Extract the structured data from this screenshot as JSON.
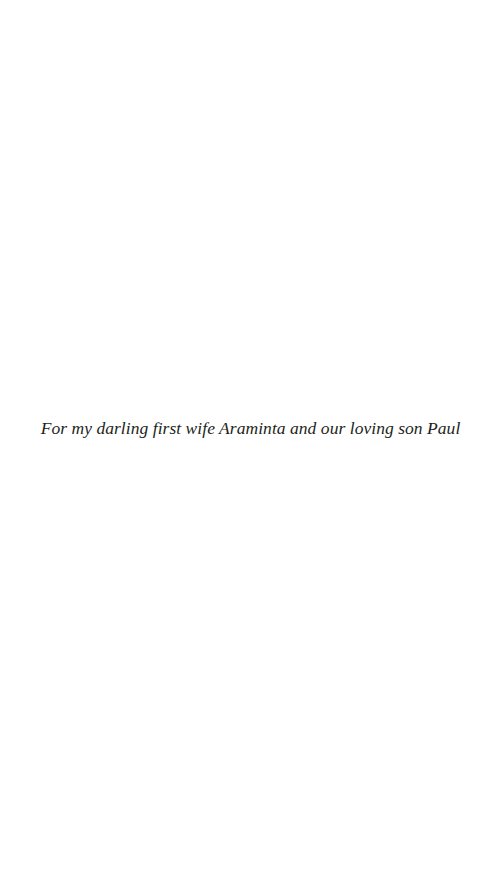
{
  "page": {
    "background": "#ffffff",
    "text_color": "#231f20"
  },
  "dedication": {
    "text": "For my darling first wife Araminta and our loving son Paul"
  }
}
